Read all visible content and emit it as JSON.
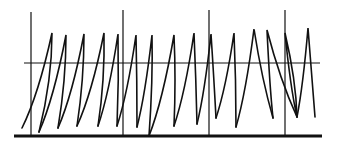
{
  "diagram": {
    "type": "sawtooth-waveform",
    "colors": {
      "stroke": "#111111",
      "background": "#ffffff"
    },
    "baseline": {
      "x1": 14,
      "x2": 322,
      "y": 136
    },
    "threshold_line": {
      "x1": 24,
      "x2": 320,
      "y": 63
    },
    "markers": [
      {
        "x": 31,
        "y1": 12,
        "y2": 136
      },
      {
        "x": 123,
        "y1": 10,
        "y2": 136
      },
      {
        "x": 209,
        "y1": 10,
        "y2": 136
      },
      {
        "x": 285,
        "y1": 10,
        "y2": 136
      }
    ],
    "waveform_points": [
      [
        22,
        128
      ],
      [
        52,
        33
      ],
      [
        39,
        132
      ],
      [
        66,
        35
      ],
      [
        58,
        128
      ],
      [
        84,
        34
      ],
      [
        77,
        126
      ],
      [
        104,
        33
      ],
      [
        98,
        126
      ],
      [
        118,
        34
      ],
      [
        117,
        126
      ],
      [
        136,
        35
      ],
      [
        137,
        127
      ],
      [
        152,
        35
      ],
      [
        149,
        136
      ],
      [
        174,
        35
      ],
      [
        174,
        126
      ],
      [
        194,
        33
      ],
      [
        197,
        124
      ],
      [
        211,
        34
      ],
      [
        216,
        118
      ],
      [
        234,
        33
      ],
      [
        236,
        127
      ],
      [
        254,
        29
      ],
      [
        273,
        118
      ],
      [
        267,
        30
      ],
      [
        297,
        117
      ],
      [
        285,
        33
      ],
      [
        315,
        117
      ],
      [
        308,
        28
      ],
      [
        315,
        117
      ]
    ],
    "segments": [
      {
        "rise": [
          [
            22,
            128
          ],
          [
            52,
            33
          ]
        ],
        "fall": [
          [
            52,
            33
          ],
          [
            52,
            80
          ],
          [
            39,
            132
          ]
        ]
      },
      {
        "rise": [
          [
            39,
            132
          ],
          [
            66,
            35
          ]
        ],
        "fall": [
          [
            66,
            35
          ],
          [
            66,
            80
          ],
          [
            58,
            128
          ]
        ]
      },
      {
        "rise": [
          [
            58,
            128
          ],
          [
            84,
            34
          ]
        ],
        "fall": [
          [
            84,
            34
          ],
          [
            84,
            80
          ],
          [
            77,
            126
          ]
        ]
      },
      {
        "rise": [
          [
            77,
            126
          ],
          [
            104,
            33
          ]
        ],
        "fall": [
          [
            104,
            33
          ],
          [
            105,
            80
          ],
          [
            98,
            126
          ]
        ]
      },
      {
        "rise": [
          [
            98,
            126
          ],
          [
            118,
            34
          ]
        ],
        "fall": [
          [
            118,
            34
          ],
          [
            119,
            80
          ],
          [
            117,
            126
          ]
        ]
      },
      {
        "rise": [
          [
            117,
            126
          ],
          [
            136,
            35
          ]
        ],
        "fall": [
          [
            136,
            35
          ],
          [
            137,
            80
          ],
          [
            137,
            127
          ]
        ]
      },
      {
        "rise": [
          [
            137,
            127
          ],
          [
            152,
            35
          ]
        ],
        "fall": [
          [
            152,
            35
          ],
          [
            153,
            80
          ],
          [
            149,
            136
          ]
        ]
      },
      {
        "rise": [
          [
            149,
            136
          ],
          [
            174,
            35
          ]
        ],
        "fall": [
          [
            174,
            35
          ],
          [
            176,
            80
          ],
          [
            174,
            126
          ]
        ]
      },
      {
        "rise": [
          [
            174,
            126
          ],
          [
            194,
            33
          ]
        ],
        "fall": [
          [
            194,
            33
          ],
          [
            196,
            80
          ],
          [
            197,
            124
          ]
        ]
      },
      {
        "rise": [
          [
            197,
            124
          ],
          [
            211,
            34
          ]
        ],
        "fall": [
          [
            211,
            34
          ],
          [
            214,
            80
          ],
          [
            216,
            118
          ]
        ]
      },
      {
        "rise": [
          [
            216,
            118
          ],
          [
            234,
            33
          ]
        ],
        "fall": [
          [
            234,
            33
          ],
          [
            236,
            80
          ],
          [
            236,
            127
          ]
        ]
      },
      {
        "rise": [
          [
            236,
            127
          ],
          [
            254,
            29
          ]
        ],
        "fall": [
          [
            254,
            29
          ],
          [
            262,
            80
          ],
          [
            273,
            118
          ]
        ]
      },
      {
        "rise": [
          [
            273,
            118
          ],
          [
            267,
            30
          ]
        ],
        "fall": [
          [
            267,
            30
          ],
          [
            280,
            80
          ],
          [
            297,
            117
          ]
        ]
      },
      {
        "rise": [
          [
            297,
            117
          ],
          [
            285,
            33
          ]
        ],
        "fall": [
          [
            285,
            33
          ],
          [
            296,
            80
          ],
          [
            297,
            117
          ]
        ]
      },
      {
        "rise": [
          [
            297,
            117
          ],
          [
            308,
            28
          ]
        ],
        "fall": [
          [
            308,
            28
          ],
          [
            312,
            80
          ],
          [
            315,
            117
          ]
        ]
      }
    ]
  }
}
